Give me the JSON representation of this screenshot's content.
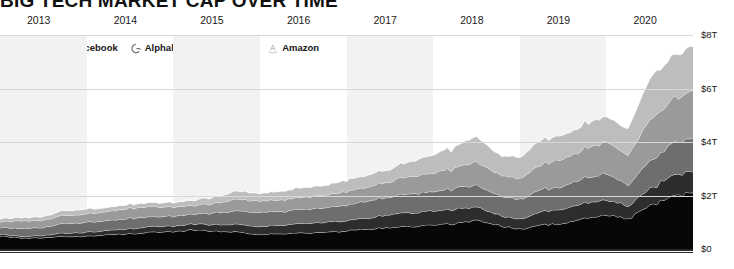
{
  "header": {
    "title": "BIG TECH MARKET CAP OVER TIME"
  },
  "legend": {
    "position": "top-left",
    "items": [
      {
        "label": "Apple",
        "icon": "apple-logo-icon",
        "color": "#070707"
      },
      {
        "label": "Facebook",
        "icon": "facebook-f-icon",
        "color": "#2d2d2d"
      },
      {
        "label": "Alphabet",
        "icon": "google-g-icon",
        "color": "#6e6e6e"
      },
      {
        "label": "Microsoft",
        "icon": "microsoft-squares-icon",
        "color": "#9a9a9a"
      },
      {
        "label": "Amazon",
        "icon": "amazon-a-icon",
        "color": "#bdbdbd"
      }
    ]
  },
  "axes": {
    "x_ticks": [
      "2013",
      "2014",
      "2015",
      "2016",
      "2017",
      "2018",
      "2019",
      "2020"
    ],
    "y_ticks": [
      "$8T",
      "$6T",
      "$4T",
      "$2T",
      "$0"
    ]
  },
  "chart_data": {
    "type": "area",
    "title": "BIG TECH MARKET CAP OVER TIME",
    "subtitle": "",
    "xlabel": "",
    "ylabel": "",
    "stacked": true,
    "grid": true,
    "legend_position": "top-left",
    "xlim": [
      2013.0,
      2021.0
    ],
    "ylim": [
      0,
      8
    ],
    "y_unit": "trillions of USD",
    "x_tick_values": [
      2013,
      2014,
      2015,
      2016,
      2017,
      2018,
      2019,
      2020
    ],
    "x_tick_labels": [
      "2013",
      "2014",
      "2015",
      "2016",
      "2017",
      "2018",
      "2019",
      "2020"
    ],
    "y_tick_values": [
      0,
      2,
      4,
      6,
      8
    ],
    "y_tick_labels": [
      "$0",
      "$2T",
      "$4T",
      "$6T",
      "$8T"
    ],
    "x": [
      2013.0,
      2013.25,
      2013.5,
      2013.75,
      2014.0,
      2014.25,
      2014.5,
      2014.75,
      2015.0,
      2015.25,
      2015.5,
      2015.75,
      2016.0,
      2016.25,
      2016.5,
      2016.75,
      2017.0,
      2017.25,
      2017.5,
      2017.75,
      2018.0,
      2018.25,
      2018.5,
      2018.75,
      2019.0,
      2019.25,
      2019.5,
      2019.75,
      2020.0,
      2020.25,
      2020.5,
      2020.75,
      2021.0
    ],
    "series": [
      {
        "name": "Apple",
        "color": "#070707",
        "values": [
          0.5,
          0.4,
          0.42,
          0.47,
          0.48,
          0.53,
          0.58,
          0.63,
          0.63,
          0.72,
          0.66,
          0.64,
          0.55,
          0.57,
          0.6,
          0.62,
          0.68,
          0.75,
          0.8,
          0.85,
          0.89,
          0.95,
          1.09,
          0.89,
          0.75,
          0.9,
          0.96,
          1.12,
          1.29,
          1.11,
          1.6,
          1.95,
          2.1
        ]
      },
      {
        "name": "Facebook",
        "color": "#2d2d2d",
        "values": [
          0.07,
          0.06,
          0.09,
          0.13,
          0.15,
          0.16,
          0.19,
          0.21,
          0.21,
          0.23,
          0.25,
          0.29,
          0.3,
          0.32,
          0.36,
          0.37,
          0.39,
          0.41,
          0.49,
          0.52,
          0.52,
          0.56,
          0.5,
          0.38,
          0.37,
          0.49,
          0.55,
          0.57,
          0.58,
          0.47,
          0.64,
          0.75,
          0.78
        ]
      },
      {
        "name": "Alphabet",
        "color": "#6e6e6e",
        "values": [
          0.25,
          0.29,
          0.3,
          0.35,
          0.37,
          0.37,
          0.39,
          0.37,
          0.37,
          0.38,
          0.44,
          0.51,
          0.52,
          0.51,
          0.54,
          0.54,
          0.58,
          0.64,
          0.66,
          0.72,
          0.73,
          0.77,
          0.81,
          0.72,
          0.75,
          0.84,
          0.84,
          0.92,
          0.99,
          0.78,
          1.02,
          1.18,
          1.25
        ]
      },
      {
        "name": "Microsoft",
        "color": "#9a9a9a",
        "values": [
          0.22,
          0.29,
          0.27,
          0.3,
          0.31,
          0.34,
          0.38,
          0.38,
          0.34,
          0.33,
          0.36,
          0.44,
          0.43,
          0.43,
          0.44,
          0.48,
          0.51,
          0.53,
          0.57,
          0.64,
          0.7,
          0.76,
          0.86,
          0.78,
          0.78,
          0.93,
          1.05,
          1.09,
          1.2,
          1.12,
          1.55,
          1.62,
          1.8
        ]
      },
      {
        "name": "Amazon",
        "color": "#bdbdbd",
        "values": [
          0.12,
          0.12,
          0.13,
          0.18,
          0.18,
          0.15,
          0.15,
          0.14,
          0.17,
          0.2,
          0.24,
          0.31,
          0.28,
          0.32,
          0.36,
          0.36,
          0.42,
          0.44,
          0.47,
          0.56,
          0.7,
          0.78,
          0.95,
          0.73,
          0.8,
          0.92,
          0.88,
          0.92,
          0.94,
          0.97,
          1.58,
          1.6,
          1.65
        ]
      }
    ],
    "annotations": []
  },
  "style": {
    "background": "#ffffff",
    "gridline_color": "#d8d8d8",
    "axis_color": "#2a2a2a",
    "band_color": "#f2f2f2",
    "series_outline": "#ffffff"
  }
}
